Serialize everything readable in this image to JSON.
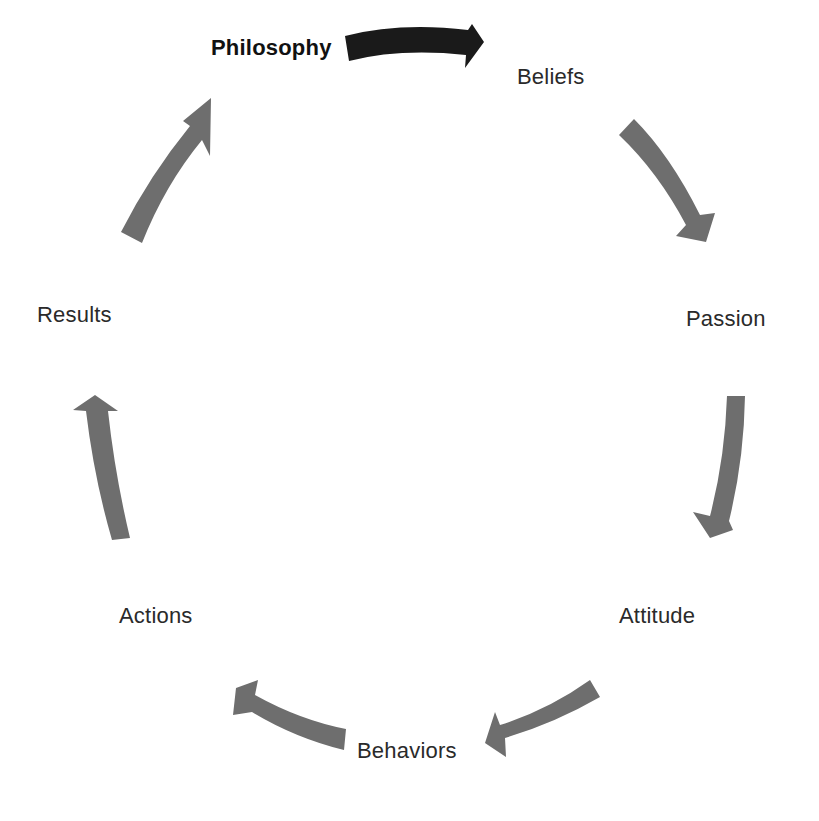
{
  "diagram": {
    "type": "cycle",
    "colors": {
      "highlight_arrow": "#1a1a1a",
      "arrow": "#6e6e6e",
      "text": "#2a2a2a",
      "background": "#ffffff"
    },
    "nodes": [
      {
        "id": "philosophy",
        "label": "Philosophy",
        "emphasis": "bold"
      },
      {
        "id": "beliefs",
        "label": "Beliefs"
      },
      {
        "id": "passion",
        "label": "Passion"
      },
      {
        "id": "attitude",
        "label": "Attitude"
      },
      {
        "id": "behaviors",
        "label": "Behaviors"
      },
      {
        "id": "actions",
        "label": "Actions"
      },
      {
        "id": "results",
        "label": "Results"
      }
    ],
    "edges": [
      {
        "from": "philosophy",
        "to": "beliefs",
        "style": "highlighted"
      },
      {
        "from": "beliefs",
        "to": "passion",
        "style": "normal"
      },
      {
        "from": "passion",
        "to": "attitude",
        "style": "normal"
      },
      {
        "from": "attitude",
        "to": "behaviors",
        "style": "normal"
      },
      {
        "from": "behaviors",
        "to": "actions",
        "style": "normal"
      },
      {
        "from": "actions",
        "to": "results",
        "style": "normal"
      },
      {
        "from": "results",
        "to": "philosophy",
        "style": "normal"
      }
    ]
  }
}
